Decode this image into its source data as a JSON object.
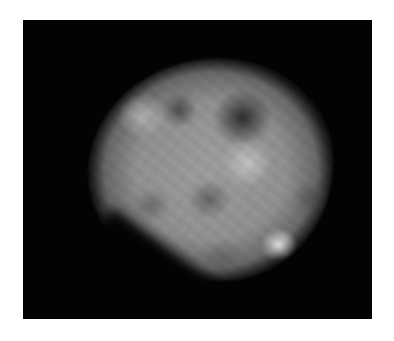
{
  "image": {
    "subject": "fluorescence micrograph of a cell nucleus",
    "background_color": "#ffffff",
    "frame_color": "#030303",
    "nucleus_base_color": "#a8a8a8",
    "features": [
      {
        "name": "dark-nucleolus-upper-right",
        "color": "#282828"
      },
      {
        "name": "dark-region-upper-left",
        "color": "#3c3c3c"
      },
      {
        "name": "bright-spot-lower-right",
        "color": "#f5f5f5"
      },
      {
        "name": "bright-region-center",
        "color": "#e1e1e1"
      },
      {
        "name": "bright-region-upper-left",
        "color": "#d7d7d7"
      }
    ]
  }
}
